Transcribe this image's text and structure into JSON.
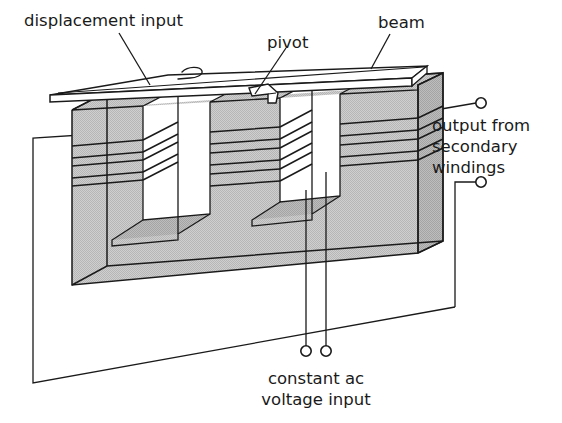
{
  "figure": {
    "type": "technical-line-diagram",
    "background_color": "#ffffff",
    "line_color": "#1a1a1a",
    "core_fill_color": "#c9c9c9",
    "core_fill_dark": "#b4b4b4",
    "beam_fill_color": "#ffffff"
  },
  "labels": {
    "displacement_input": "displacement input",
    "pivot": "pivot",
    "beam": "beam",
    "output_line1": "output from",
    "output_line2": "secondary",
    "output_line3": "windings",
    "ac_line1": "constant ac",
    "ac_line2": "voltage input"
  },
  "terminals": {
    "output_top": {
      "cx": 481,
      "cy": 103,
      "r": 5.2
    },
    "output_bottom": {
      "cx": 481,
      "cy": 182,
      "r": 5.2
    },
    "ac_left": {
      "cx": 306,
      "cy": 351,
      "r": 5.2
    },
    "ac_right": {
      "cx": 326,
      "cy": 351,
      "r": 5.2
    }
  },
  "core": {
    "leg_count": 3,
    "legs": [
      {
        "name": "left-leg",
        "winding_bands": 5
      },
      {
        "name": "center-leg",
        "winding_bands": 5
      },
      {
        "name": "right-leg",
        "winding_bands": 5
      }
    ],
    "window_count": 2
  }
}
